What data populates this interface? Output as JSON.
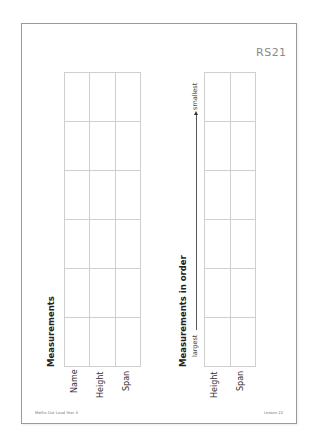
{
  "document": {
    "code": "RS21",
    "footer_left": "Maths Out Loud Year 3",
    "footer_right": "Lesson 22"
  },
  "measurements_table": {
    "heading": "Measurements",
    "columns": [
      "Name",
      "Height",
      "Span"
    ],
    "row_count": 6
  },
  "ordered_table": {
    "heading": "Measurements in order",
    "columns": [
      "Height",
      "Span"
    ],
    "row_count": 6,
    "direction_start": "largest",
    "direction_end": "smallest"
  },
  "colors": {
    "border": "#9a9a9a",
    "grid_line": "#cfcfcf",
    "code_text": "#8a8a8a"
  }
}
